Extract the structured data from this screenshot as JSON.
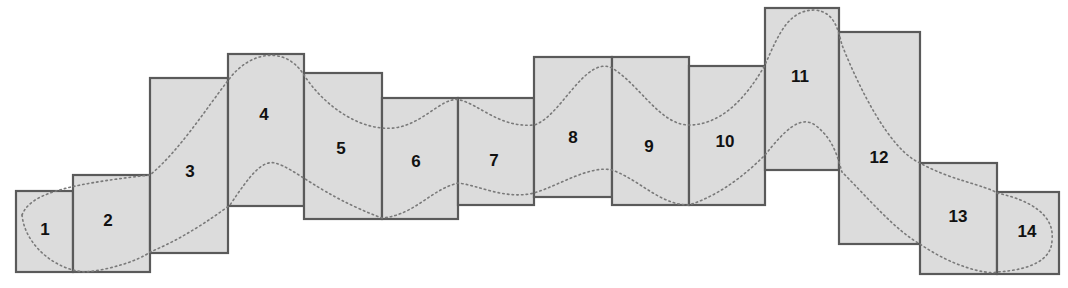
{
  "diagram": {
    "fill_color": "#dcdcdc",
    "stroke_color": "#5a5a5a",
    "curve_color": "#7a7a7a",
    "boxes": [
      {
        "label": "1",
        "x": 16,
        "y": 191,
        "w": 57,
        "h": 81
      },
      {
        "label": "2",
        "x": 73,
        "y": 175,
        "w": 77,
        "h": 97
      },
      {
        "label": "3",
        "x": 150,
        "y": 78,
        "w": 78,
        "h": 175
      },
      {
        "label": "4",
        "x": 228,
        "y": 54,
        "w": 76,
        "h": 152
      },
      {
        "label": "5",
        "x": 304,
        "y": 73,
        "w": 78,
        "h": 146
      },
      {
        "label": "6",
        "x": 382,
        "y": 98,
        "w": 76,
        "h": 121
      },
      {
        "label": "7",
        "x": 458,
        "y": 98,
        "w": 76,
        "h": 107
      },
      {
        "label": "8",
        "x": 534,
        "y": 57,
        "w": 78,
        "h": 140
      },
      {
        "label": "9",
        "x": 612,
        "y": 57,
        "w": 77,
        "h": 148
      },
      {
        "label": "10",
        "x": 689,
        "y": 66,
        "w": 76,
        "h": 139
      },
      {
        "label": "11",
        "x": 765,
        "y": 8,
        "w": 74,
        "h": 162
      },
      {
        "label": "12",
        "x": 839,
        "y": 32,
        "w": 81,
        "h": 212
      },
      {
        "label": "13",
        "x": 920,
        "y": 163,
        "w": 77,
        "h": 111
      },
      {
        "label": "14",
        "x": 997,
        "y": 192,
        "w": 62,
        "h": 82
      }
    ],
    "label_positions": [
      {
        "x": 45,
        "y": 231
      },
      {
        "x": 108,
        "y": 222
      },
      {
        "x": 190,
        "y": 173
      },
      {
        "x": 264,
        "y": 116
      },
      {
        "x": 341,
        "y": 150
      },
      {
        "x": 416,
        "y": 163
      },
      {
        "x": 494,
        "y": 162
      },
      {
        "x": 573,
        "y": 139
      },
      {
        "x": 649,
        "y": 148
      },
      {
        "x": 725,
        "y": 143
      },
      {
        "x": 800,
        "y": 78
      },
      {
        "x": 879,
        "y": 159
      },
      {
        "x": 958,
        "y": 218
      },
      {
        "x": 1027,
        "y": 233
      }
    ],
    "upper_curve_path": "M 22 215 C 30 195, 60 185, 150 175 C 180 150, 205 110, 230 78 C 250 52, 285 45, 304 75 C 320 100, 350 125, 382 128 C 420 132, 440 95, 460 100 C 480 105, 500 128, 534 125 C 560 118, 585 55, 612 68 C 640 85, 660 125, 689 125 C 720 125, 745 100, 765 65 C 780 30, 790 10, 815 10 C 835 12, 838 30, 842 45 C 860 90, 890 150, 920 163 C 950 180, 985 185, 997 193 C 1030 200, 1055 215, 1052 240",
    "lower_curve_path": "M 22 215 C 25 245, 55 270, 85 272 C 110 270, 140 260, 150 252 C 180 240, 210 220, 230 205 C 250 175, 262 160, 275 163 C 295 168, 320 195, 382 218 C 415 215, 430 190, 458 183 C 478 185, 505 200, 534 193 C 560 185, 590 165, 612 170 C 640 180, 660 205, 689 205 C 720 195, 745 175, 765 155 C 785 130, 800 115, 815 125 C 835 140, 838 160, 842 172 C 870 200, 895 230, 920 244 C 950 265, 985 275, 997 272 C 1030 270, 1052 260, 1052 240"
  }
}
